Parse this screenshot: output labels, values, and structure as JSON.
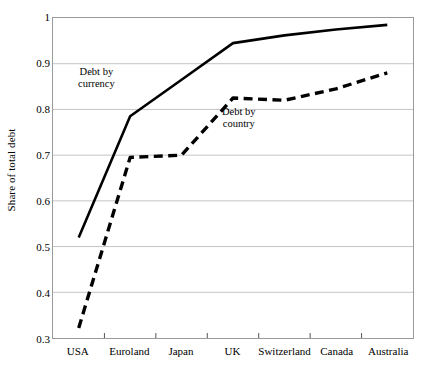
{
  "chart_data": {
    "type": "line",
    "title": "",
    "xlabel": "",
    "ylabel": "Share of total debt",
    "categories": [
      "USA",
      "Euroland",
      "Japan",
      "UK",
      "Switzerland",
      "Canada",
      "Australia"
    ],
    "ylim": [
      0.3,
      1
    ],
    "yticks": [
      "0.3",
      "0.4",
      "0.5",
      "0.6",
      "0.7",
      "0.8",
      "0.9",
      "1"
    ],
    "ytick_values": [
      0.3,
      0.4,
      0.5,
      0.6,
      0.7,
      0.8,
      0.9,
      1
    ],
    "grid": true,
    "legend": "annotations-inline",
    "series": [
      {
        "name": "Debt by currency",
        "style": "solid",
        "color": "#000000",
        "values": [
          0.52,
          0.785,
          0.865,
          0.945,
          0.962,
          0.975,
          0.985
        ]
      },
      {
        "name": "Debt by country",
        "style": "dashed",
        "color": "#000000",
        "values": [
          0.322,
          0.695,
          0.7,
          0.825,
          0.82,
          0.845,
          0.88
        ]
      }
    ],
    "annotations": [
      {
        "text_line1": "Debt by",
        "text_line2": "currency"
      },
      {
        "text_line1": "Debt by",
        "text_line2": "country"
      }
    ]
  }
}
